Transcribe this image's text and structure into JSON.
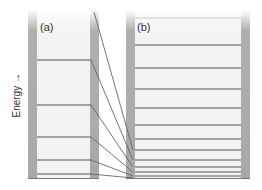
{
  "diagram": {
    "axis_label": "Energy →",
    "panels": [
      {
        "label": "(a)",
        "levels_y": [
          60,
          105,
          137,
          160,
          174
        ]
      },
      {
        "label": "(b)",
        "levels_y": [
          18,
          45,
          68,
          89,
          108,
          125,
          139,
          150,
          160,
          167,
          172,
          176
        ]
      }
    ],
    "connector_count": 6,
    "colors": {
      "wall": "#a8a8a8",
      "interior": "#f4f4f4",
      "line": "#555555",
      "connector": "#666666"
    }
  }
}
